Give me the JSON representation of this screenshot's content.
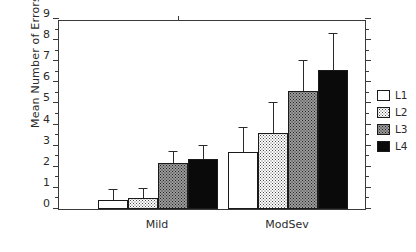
{
  "chart_data": {
    "type": "bar",
    "title": "",
    "subtitle": "",
    "xlabel": "",
    "ylabel": "Mean Number of Errors",
    "categories": [
      "Mild",
      "ModSev"
    ],
    "ylim": [
      0,
      9
    ],
    "ytick_labels": [
      "0",
      "1",
      "2",
      "3",
      "4",
      "5",
      "6",
      "7",
      "8",
      "9"
    ],
    "ytick_values": [
      0,
      1,
      2,
      3,
      4,
      5,
      6,
      7,
      8,
      9
    ],
    "y_minor_ticks": [
      0.5,
      1.5,
      2.5,
      3.5,
      4.5,
      5.5,
      6.5,
      7.5,
      8.5
    ],
    "grid": false,
    "legend_position": "right",
    "error_bars": "upper only",
    "series": [
      {
        "name": "L1",
        "fill": "white",
        "color": "#ffffff",
        "values": [
          0.45,
          2.7
        ],
        "errors_upper": [
          0.9,
          3.85
        ]
      },
      {
        "name": "L2",
        "fill": "light-stipple",
        "color": "#e8e8e8",
        "values": [
          0.5,
          3.6
        ],
        "errors_upper": [
          0.95,
          5.0
        ]
      },
      {
        "name": "L3",
        "fill": "gray-stipple",
        "color": "#9a9a9a",
        "values": [
          2.2,
          5.6
        ],
        "errors_upper": [
          2.7,
          7.0
        ]
      },
      {
        "name": "L4",
        "fill": "solid-black",
        "color": "#0a0a0a",
        "values": [
          2.35,
          6.6
        ],
        "errors_upper": [
          3.0,
          8.3
        ]
      }
    ]
  },
  "legend": {
    "items": [
      {
        "label": "L1"
      },
      {
        "label": "L2"
      },
      {
        "label": "L3"
      },
      {
        "label": "L4"
      }
    ]
  }
}
